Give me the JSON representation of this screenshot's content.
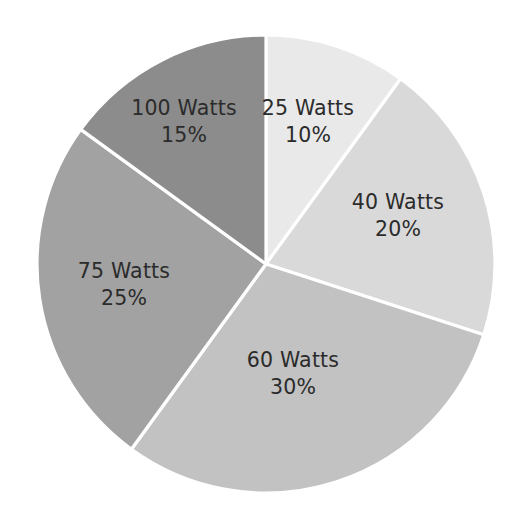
{
  "chart_data": {
    "type": "pie",
    "title": "",
    "subtitle": "",
    "xlabel": "",
    "ylabel": "",
    "legend": "none",
    "grid": false,
    "start_angle_deg": 0,
    "direction": "clockwise",
    "categories": [
      "25 Watts",
      "40 Watts",
      "60 Watts",
      "75 Watts",
      "100 Watts"
    ],
    "values": [
      10,
      20,
      30,
      25,
      15
    ],
    "value_unit": "%",
    "labels": [
      "25 Watts\n10%",
      "40 Watts\n20%",
      "60 Watts\n30%",
      "75 Watts\n25%",
      "100 Watts\n15%"
    ],
    "colors": [
      "#e9e9e9",
      "#d9d9d9",
      "#c2c2c2",
      "#a2a2a2",
      "#8c8c8c"
    ],
    "slices": [
      {
        "name": "25 Watts",
        "percent_label": "10%",
        "value": 10,
        "color": "#e9e9e9",
        "start_deg": 0,
        "end_deg": 36,
        "label_x": 308,
        "label_y": 122
      },
      {
        "name": "40 Watts",
        "percent_label": "20%",
        "value": 20,
        "color": "#d9d9d9",
        "start_deg": 36,
        "end_deg": 108,
        "label_x": 398,
        "label_y": 216
      },
      {
        "name": "60 Watts",
        "percent_label": "30%",
        "value": 30,
        "color": "#c2c2c2",
        "start_deg": 108,
        "end_deg": 216,
        "label_x": 293,
        "label_y": 374
      },
      {
        "name": "75 Watts",
        "percent_label": "25%",
        "value": 25,
        "color": "#a2a2a2",
        "start_deg": 216,
        "end_deg": 306,
        "label_x": 124,
        "label_y": 285
      },
      {
        "name": "100 Watts",
        "percent_label": "15%",
        "value": 15,
        "color": "#8c8c8c",
        "start_deg": 306,
        "end_deg": 360,
        "label_x": 184,
        "label_y": 122
      }
    ],
    "geometry": {
      "center_x": 266,
      "center_y": 264,
      "radius": 229,
      "separator_color": "#ffffff",
      "background": "#ffffff",
      "label_text_color": "#2b2b2b"
    }
  }
}
